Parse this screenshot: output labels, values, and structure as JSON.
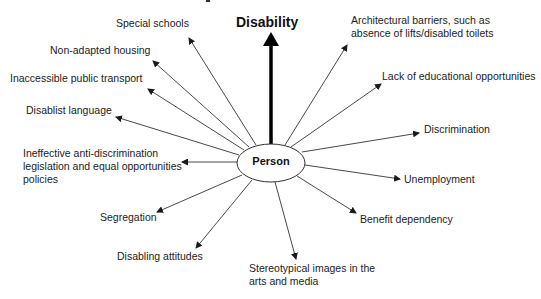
{
  "diagram": {
    "type": "radial-concept-map",
    "top_label": "Disability",
    "center_node": "Person",
    "factors": {
      "special_schools": "Special schools",
      "non_adapted_housing": "Non-adapted housing",
      "inaccessible_transport": "Inaccessible public transport",
      "disablist_language": "Disablist language",
      "ineffective_legislation_1": "Ineffective anti-discrimination",
      "ineffective_legislation_2": "legislation and equal opportunities",
      "ineffective_legislation_3": "policies",
      "segregation": "Segregation",
      "disabling_attitudes": "Disabling attitudes",
      "stereotypical_images_1": "Stereotypical images in the",
      "stereotypical_images_2": "arts and media",
      "benefit_dependency": "Benefit dependency",
      "unemployment": "Unemployment",
      "discrimination": "Discrimination",
      "lack_educational": "Lack of educational opportunities",
      "architectural_barriers_1": "Architectural barriers, such as",
      "architectural_barriers_2": "absence of lifts/disabled toilets"
    },
    "colors": {
      "line": "#333333",
      "text": "#222222",
      "background": "#ffffff"
    }
  }
}
